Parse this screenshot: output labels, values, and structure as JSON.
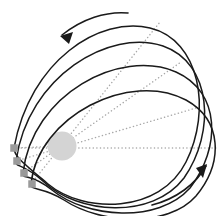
{
  "figure": {
    "background_color": "#ffffff"
  },
  "colors": {
    "orbit_stroke": "#1a1a1a",
    "apsidal_dotted": "#a8a8a8",
    "central_body_fill": "#d4d4d4",
    "perihelion_marker_fill": "#9a9a9a",
    "arrow_stroke": "#1a1a1a"
  },
  "central_body": {
    "name": "central-mass",
    "cx": 62,
    "cy": 146,
    "r": 14.5,
    "fill": "#d4d4d4"
  },
  "orbits": [
    {
      "id": "orbit-1",
      "label": "outermost orbit",
      "path": "M 14 148 C 30 60, 100 16, 150 28 C 200 40, 212 110, 186 162 C 160 214, 84 214, 48 184 C 22 162, 14 156, 14 148 Z",
      "stroke_width": 1.5
    },
    {
      "id": "orbit-2",
      "label": "second orbit",
      "path": "M 16 161 C 28 76, 110 28, 163 46 C 212 63, 216 132, 184 178 C 152 220, 78 214, 44 182 C 22 162, 15 168, 16 161 Z",
      "stroke_width": 1.5
    },
    {
      "id": "orbit-3",
      "label": "third orbit",
      "path": "M 23 173 C 32 94, 120 48, 176 72 C 221 92, 221 148, 190 188 C 158 224, 86 218, 52 190 C 30 172, 22 180, 23 173 Z",
      "stroke_width": 1.5
    },
    {
      "id": "orbit-4",
      "label": "innermost drawn orbit",
      "path": "M 31 184 C 38 116, 130 70, 186 100 C 222 120, 224 162, 196 196 C 168 228, 100 224, 64 200 C 42 186, 30 191, 31 184 Z",
      "stroke_width": 1.5
    }
  ],
  "apsidal_lines": [
    {
      "id": "apsidal-horizontal",
      "label": "reference apsidal line",
      "x1": 14,
      "y1": 148,
      "x2": 216,
      "y2": 148
    },
    {
      "id": "apsidal-1",
      "label": "apsidal line orbit 1",
      "x1": 16,
      "y1": 161,
      "x2": 196,
      "y2": 108
    },
    {
      "id": "apsidal-2",
      "label": "apsidal line orbit 2",
      "x1": 23,
      "y1": 173,
      "x2": 181,
      "y2": 62
    },
    {
      "id": "apsidal-3",
      "label": "apsidal line orbit 3",
      "x1": 31,
      "y1": 184,
      "x2": 160,
      "y2": 22
    },
    {
      "id": "apsidal-4",
      "label": "apsidal line to centre",
      "x1": 62,
      "y1": 146,
      "x2": 14,
      "y2": 148
    }
  ],
  "perihelion_markers": [
    {
      "id": "perihelion-1",
      "label": "perihelion point 1",
      "x": 14,
      "y": 148,
      "size": 7.5
    },
    {
      "id": "perihelion-2",
      "label": "perihelion point 2",
      "x": 17,
      "y": 161,
      "size": 7.5
    },
    {
      "id": "perihelion-3",
      "label": "perihelion point 3",
      "x": 24,
      "y": 173,
      "size": 7.5
    },
    {
      "id": "perihelion-4",
      "label": "perihelion point 4",
      "x": 32,
      "y": 184,
      "size": 7.5
    }
  ],
  "arrows": [
    {
      "id": "arrow-top",
      "label": "precession direction arrow, upper left, pointing down-left",
      "path": "M 128 13 C 106 11, 82 19, 62 35",
      "head_points": "60,36 73,32 69,44"
    },
    {
      "id": "arrow-bottom",
      "label": "precession direction arrow, lower right, pointing up-right",
      "path": "M 152 205 C 176 199, 196 184, 206 166",
      "head_points": "207,164 203,178 196,168"
    }
  ]
}
